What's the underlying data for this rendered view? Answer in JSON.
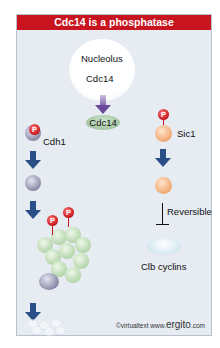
{
  "title": "Cdc14 is a phosphatase",
  "nucleolus": {
    "label": "Nucleolus",
    "protein": "Cdc14"
  },
  "released_protein": "Cdc14",
  "left_pathway": {
    "substrate": "Cdh1",
    "phospho_label": "P",
    "steps": [
      "Cdh1 phosphorylated",
      "Cdh1 dephosphorylated",
      "APC complex with phosphorylated subunits",
      "Degraded"
    ]
  },
  "right_pathway": {
    "substrate": "Sic1",
    "phospho_label": "P",
    "inhibition_label": "Reversible",
    "target": "Clb cyclins"
  },
  "credit": {
    "prefix": "©virtualtext www.",
    "brand": "ergito",
    "suffix": ".com"
  },
  "colors": {
    "title_bg": "#c8141e",
    "arrow": "#2a4f86",
    "panel_bg": "#e6ecf2",
    "phospho": "#c8141e"
  }
}
